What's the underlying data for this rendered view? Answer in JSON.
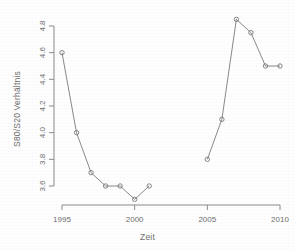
{
  "chart_data": {
    "type": "line",
    "title": "",
    "subtitle": "",
    "xlabel": "Zeit",
    "ylabel": "S80/S20 Verhältnis",
    "xlim": [
      1994.2,
      2010.6
    ],
    "ylim": [
      3.45,
      4.88
    ],
    "grid": false,
    "legend": null,
    "marker": "open-circle",
    "line_color": "#7a7a7a",
    "marker_color": "#7a7a7a",
    "x_ticks": [
      1995,
      2000,
      2005,
      2010
    ],
    "x_tick_labels": [
      "1995",
      "2000",
      "2005",
      "2010"
    ],
    "y_ticks": [
      3.6,
      3.8,
      4.0,
      4.2,
      4.4,
      4.6,
      4.8
    ],
    "y_tick_labels": [
      "3.6",
      "3.8",
      "4.0",
      "4.2",
      "4.4",
      "4.6",
      "4.8"
    ],
    "series": [
      {
        "name": "S80/S20 Verhältnis",
        "segments": [
          {
            "x": [
              1995,
              1996,
              1997,
              1998,
              1999,
              2000,
              2001
            ],
            "y": [
              4.6,
              4.0,
              3.7,
              3.6,
              3.6,
              3.5,
              3.6
            ]
          },
          {
            "x": [
              2005,
              2006,
              2007,
              2008,
              2009,
              2010
            ],
            "y": [
              3.8,
              4.1,
              4.85,
              4.75,
              4.5,
              4.5
            ]
          }
        ]
      }
    ],
    "note": "gap in data between 2001 and 2005"
  },
  "axes": {
    "y_axis_title": "S80/S20 Verhältnis",
    "x_axis_title": "Zeit"
  }
}
